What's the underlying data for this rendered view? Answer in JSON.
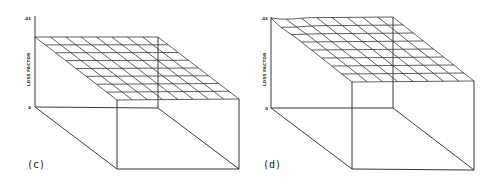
{
  "figure": {
    "panels": [
      {
        "id": "c",
        "label": "(c)",
        "axis_label": "LOSS FACTOR",
        "tick_top": ".01",
        "tick_bottom": "0",
        "surface": "flat plane with 8x8 grid, no variation"
      },
      {
        "id": "d",
        "label": "(d)",
        "axis_label": "LOSS FACTOR",
        "tick_top": ".01",
        "tick_bottom": "0",
        "surface": "plane with 8x8 grid, slight bump near back-left corner"
      }
    ]
  },
  "chart_data": [
    {
      "type": "surface",
      "title": "(c)",
      "zlabel": "LOSS FACTOR",
      "zlim": [
        0,
        0.01
      ],
      "grid": "8x8",
      "description": "Flat surface at roughly constant loss factor"
    },
    {
      "type": "surface",
      "title": "(d)",
      "zlabel": "LOSS FACTOR",
      "zlim": [
        0,
        0.01
      ],
      "grid": "8x8",
      "description": "Near-flat surface at top of range, with small ripple near back-left corner"
    }
  ]
}
